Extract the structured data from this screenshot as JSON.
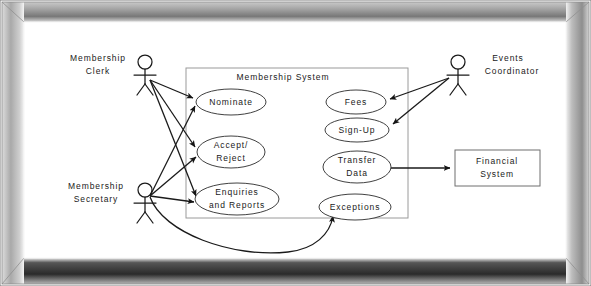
{
  "diagram": {
    "type": "uml-use-case-diagram",
    "system_boundary": {
      "label": "Membership System",
      "x": 186,
      "y": 68,
      "width": 222,
      "height": 150
    },
    "actors": [
      {
        "id": "membership-clerk",
        "label_line1": "Membership",
        "label_line2": "Clerk",
        "x": 145,
        "y": 62,
        "label_x": 98,
        "label_y": 62
      },
      {
        "id": "membership-secretary",
        "label_line1": "Membership",
        "label_line2": "Secretary",
        "x": 145,
        "y": 190,
        "label_x": 98,
        "label_y": 190
      },
      {
        "id": "events-coordinator",
        "label_line1": "Events",
        "label_line2": "Coordinator",
        "x": 458,
        "y": 62,
        "label_x": 508,
        "label_y": 62
      }
    ],
    "use_cases": [
      {
        "id": "nominate",
        "label_line1": "Nominate",
        "label_line2": "",
        "cx": 231,
        "cy": 102,
        "rx": 35,
        "ry": 13
      },
      {
        "id": "accept-reject",
        "label_line1": "Accept/",
        "label_line2": "Reject",
        "cx": 231,
        "cy": 152,
        "rx": 34,
        "ry": 16
      },
      {
        "id": "enquiries-and-reports",
        "label_line1": "Enquiries",
        "label_line2": "and Reports",
        "cx": 237,
        "cy": 199,
        "rx": 42,
        "ry": 16
      },
      {
        "id": "fees",
        "label_line1": "Fees",
        "label_line2": "",
        "cx": 356,
        "cy": 102,
        "rx": 30,
        "ry": 12
      },
      {
        "id": "sign-up",
        "label_line1": "Sign-Up",
        "label_line2": "",
        "cx": 357,
        "cy": 130,
        "rx": 32,
        "ry": 12
      },
      {
        "id": "transfer-data",
        "label_line1": "Transfer",
        "label_line2": "Data",
        "cx": 357,
        "cy": 167,
        "rx": 34,
        "ry": 16
      },
      {
        "id": "exceptions",
        "label_line1": "Exceptions",
        "label_line2": "",
        "cx": 355,
        "cy": 207,
        "rx": 36,
        "ry": 13
      }
    ],
    "external_systems": [
      {
        "id": "financial-system",
        "label_line1": "Financial",
        "label_line2": "System",
        "x": 455,
        "y": 150,
        "width": 85,
        "height": 36
      }
    ],
    "associations": [
      {
        "from": "membership-clerk",
        "to": "nominate",
        "arrow": true
      },
      {
        "from": "membership-clerk",
        "to": "accept-reject",
        "arrow": true
      },
      {
        "from": "membership-clerk",
        "to": "enquiries-and-reports",
        "arrow": true
      },
      {
        "from": "membership-secretary",
        "to": "nominate",
        "arrow": true
      },
      {
        "from": "membership-secretary",
        "to": "accept-reject",
        "arrow": true
      },
      {
        "from": "membership-secretary",
        "to": "enquiries-and-reports",
        "arrow": true
      },
      {
        "from": "membership-secretary",
        "to": "exceptions",
        "arrow": true,
        "curved": true
      },
      {
        "from": "events-coordinator",
        "to": "fees",
        "arrow": true
      },
      {
        "from": "events-coordinator",
        "to": "sign-up",
        "arrow": true
      },
      {
        "from": "transfer-data",
        "to": "financial-system",
        "arrow": true
      }
    ]
  },
  "frame": {
    "style": "beveled-picture-frame",
    "outer_color": "#b9b9b9",
    "highlight_color": "#f2f2f2",
    "shadow_color": "#2e2e2e",
    "canvas_color": "#ffffff"
  }
}
